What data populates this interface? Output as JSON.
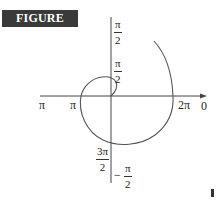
{
  "figure": {
    "label": "FIGURE 10.26"
  },
  "axes": {
    "horizontal_axis_label": "0",
    "labels": {
      "top_pi_over_2": {
        "num": "π",
        "den": "2"
      },
      "inner_pi_over_2": {
        "num": "π",
        "den": "2"
      },
      "left_pi_outer": "π",
      "left_pi_inner": "π",
      "two_pi": "2π",
      "zero": "0",
      "three_pi_over_2": {
        "num": "3π",
        "den": "2"
      },
      "neg_pi_over_2": {
        "sign": "−",
        "num": "π",
        "den": "2"
      }
    }
  },
  "curve": {
    "description": "polar spiral curve",
    "stroke_color": "#555555"
  }
}
